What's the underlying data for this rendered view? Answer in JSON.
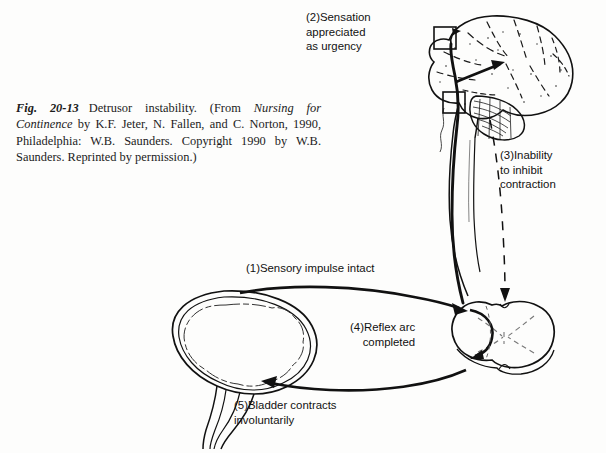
{
  "figure": {
    "number": "Fig. 20-13",
    "title": "Detrusor instability.",
    "source_prefix": "(From ",
    "source_title": "Nursing for Continence",
    "source_rest": " by K.F. Jeter, N. Fallen, and C. Norton, 1990, Philadelphia: W.B. Saunders. Copyright 1990 by W.B. Saunders. Reprinted by permission.)",
    "full_caption": "Fig. 20-13  Detrusor instability. (From Nursing for Continence by K.F. Jeter, N. Fallen, and C. Norton, 1990, Philadelphia: W.B. Saunders. Copyright 1990 by W.B. Saunders. Reprinted by permission.)"
  },
  "annotations": {
    "step1": "(1)Sensory impulse intact",
    "step2": "(2)Sensation\n    appreciated\n    as urgency",
    "step3": "(3)Inability\n    to inhibit\n    contraction",
    "step4": "(4)Reflex arc\n  completed",
    "step5": "(5)Bladder contracts\n    involuntarily"
  },
  "anatomy": {
    "brain_label": "brain-lateral-view",
    "cerebellum_label": "cerebellum",
    "brainstem_label": "brainstem",
    "spinal_cord_label": "spinal-cord",
    "spinal_cord_cross_section_label": "spinal-cord-cross-section",
    "bladder_label": "urinary-bladder",
    "urethra_label": "urethra",
    "cortical_center_label": "cortical-micturition-center",
    "pontine_center_label": "pontine-micturition-center"
  },
  "pathways": {
    "sensory_afferent": "bladder-to-spinal-cord-afferent-arrow",
    "ascending_tract": "ascending-sensory-tract",
    "descending_inhibition": "descending-inhibitory-tract-dashed",
    "motor_efferent": "spinal-cord-to-bladder-efferent-arrow"
  },
  "colors": {
    "ink": "#111111",
    "background": "#fdfdfc",
    "light_ink": "#3a3a3a"
  }
}
